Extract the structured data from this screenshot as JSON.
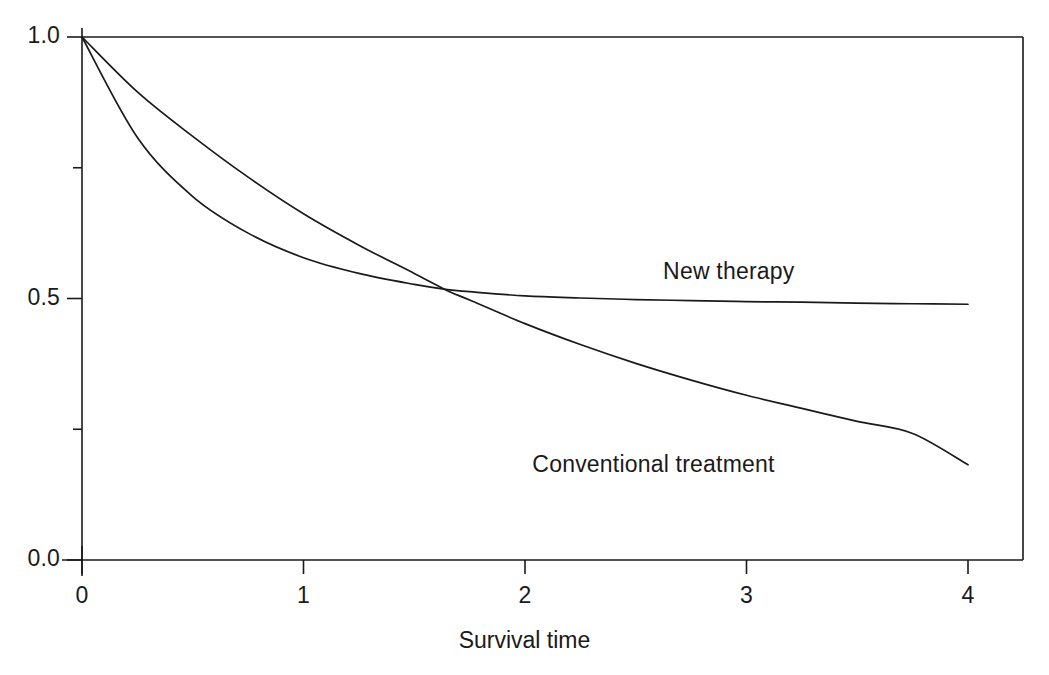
{
  "chart_data": {
    "type": "line",
    "title": "",
    "subtitle": "",
    "xlabel": "Survival time",
    "ylabel": "",
    "xlim": [
      0,
      4.25
    ],
    "ylim": [
      0,
      1.0
    ],
    "grid": false,
    "legend_position": "inline-annotation",
    "x_ticks": [
      {
        "value": 0,
        "label": "0"
      },
      {
        "value": 1,
        "label": "1"
      },
      {
        "value": 2,
        "label": "2"
      },
      {
        "value": 3,
        "label": "3"
      },
      {
        "value": 4,
        "label": "4"
      }
    ],
    "y_ticks": [
      {
        "value": 0.0,
        "label": "0.0",
        "minor": false
      },
      {
        "value": 0.25,
        "label": "",
        "minor": true
      },
      {
        "value": 0.5,
        "label": "0.5",
        "minor": false
      },
      {
        "value": 0.75,
        "label": "",
        "minor": true
      },
      {
        "value": 1.0,
        "label": "1.0",
        "minor": false
      }
    ],
    "x": [
      0,
      0.25,
      0.5,
      0.75,
      1,
      1.25,
      1.5,
      1.65,
      1.75,
      2,
      2.25,
      2.5,
      2.75,
      3,
      3.25,
      3.5,
      3.75,
      4
    ],
    "series": [
      {
        "name": "Conventional treatment",
        "values": [
          1.0,
          0.895,
          0.81,
          0.732,
          0.662,
          0.602,
          0.548,
          0.515,
          0.497,
          0.452,
          0.412,
          0.376,
          0.344,
          0.315,
          0.29,
          0.265,
          0.242,
          0.182
        ],
        "annotation": "Conventional treatment",
        "annotation_x": 2.58,
        "annotation_y": 0.178
      },
      {
        "name": "New therapy",
        "values": [
          1.0,
          0.808,
          0.695,
          0.625,
          0.578,
          0.548,
          0.527,
          0.517,
          0.513,
          0.505,
          0.501,
          0.498,
          0.496,
          0.494,
          0.493,
          0.491,
          0.49,
          0.489
        ],
        "annotation": "New therapy",
        "annotation_x": 2.92,
        "annotation_y": 0.547
      }
    ],
    "annotations": [
      {
        "text": "New therapy",
        "x": 2.92,
        "y": 0.547
      },
      {
        "text": "Conventional treatment",
        "x": 2.58,
        "y": 0.178
      }
    ],
    "axis_color": "#1a1a1a",
    "line_color": "#1a1a1a",
    "background_color": "#ffffff"
  }
}
